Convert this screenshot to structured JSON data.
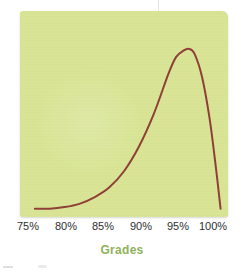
{
  "figure": {
    "name": "grades-distribution-figure",
    "panel_color": "#d7e392",
    "curve_color": "#8e4038",
    "axis_title": "Grades",
    "axis_title_color": "#8fb25a",
    "tick_color": "#2e2e30"
  },
  "axis": {
    "ticks": [
      {
        "label": "75%",
        "x": 28
      },
      {
        "label": "80%",
        "x": 66
      },
      {
        "label": "85%",
        "x": 103
      },
      {
        "label": "90%",
        "x": 141
      },
      {
        "label": "95%",
        "x": 178
      },
      {
        "label": "100%",
        "x": 213
      }
    ]
  },
  "chart_data": {
    "type": "line",
    "title": "",
    "subtitle": "",
    "xlabel": "Grades",
    "ylabel": "",
    "xlim": [
      73,
      101
    ],
    "ylim": [
      0,
      1
    ],
    "xticks": [
      "75%",
      "80%",
      "85%",
      "90%",
      "95%",
      "100%"
    ],
    "yticks": [],
    "grid": false,
    "legend": null,
    "annotations": [],
    "series": [
      {
        "name": "Grade distribution",
        "color": "#8e4038",
        "line_width": 2,
        "description": "Strongly left-skewed unimodal density: flat near zero from 75% to about 82%, rising with increasing steepness through 88-93%, peaking just under 96%, then falling almost vertically to near zero at 100%.",
        "x": [
          75,
          77,
          79,
          81,
          83,
          85,
          87,
          89,
          91,
          93,
          94,
          95,
          95.8,
          96.5,
          97.5,
          98.5,
          99.3,
          100
        ],
        "y": [
          0.02,
          0.02,
          0.03,
          0.05,
          0.09,
          0.15,
          0.25,
          0.4,
          0.6,
          0.85,
          0.95,
          0.99,
          1.0,
          0.97,
          0.83,
          0.58,
          0.3,
          0.02
        ]
      }
    ]
  }
}
